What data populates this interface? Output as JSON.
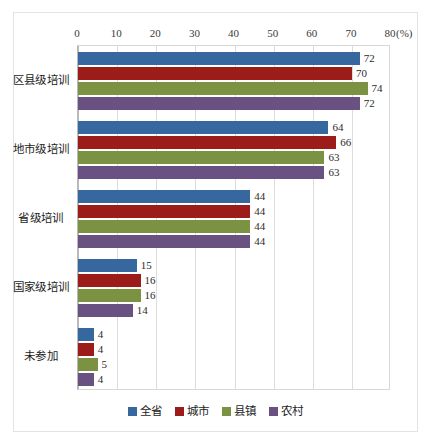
{
  "chart_data": {
    "type": "bar",
    "orientation": "horizontal",
    "title": "",
    "xlabel": "(%)",
    "ylabel": "",
    "xlim": [
      0,
      80
    ],
    "xticks": [
      0,
      10,
      20,
      30,
      40,
      50,
      60,
      70,
      80
    ],
    "xtick_labels": [
      "0",
      "10",
      "20",
      "30",
      "40",
      "50",
      "60",
      "70",
      "80"
    ],
    "unit_label": "(%)",
    "grid": true,
    "legend_position": "bottom",
    "categories": [
      "区县级培训",
      "地市级培训",
      "省级培训",
      "国家级培训",
      "未参加"
    ],
    "series": [
      {
        "name": "全省",
        "color": "#36679e",
        "values": [
          72,
          64,
          44,
          15,
          4
        ]
      },
      {
        "name": "城市",
        "color": "#9c1c19",
        "values": [
          70,
          66,
          44,
          16,
          4
        ]
      },
      {
        "name": "县镇",
        "color": "#7b9243",
        "values": [
          74,
          63,
          44,
          16,
          5
        ]
      },
      {
        "name": "农村",
        "color": "#695182",
        "values": [
          72,
          63,
          44,
          14,
          4
        ]
      }
    ]
  },
  "legend": {
    "items": [
      {
        "label": "全省",
        "color": "#36679e"
      },
      {
        "label": "城市",
        "color": "#9c1c19"
      },
      {
        "label": "县镇",
        "color": "#7b9243"
      },
      {
        "label": "农村",
        "color": "#695182"
      }
    ]
  }
}
